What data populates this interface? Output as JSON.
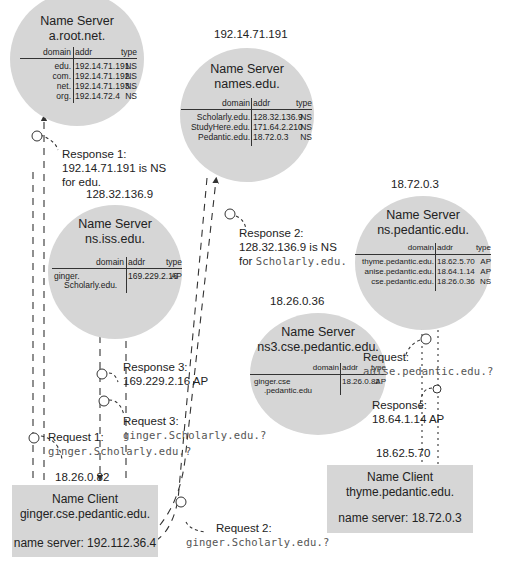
{
  "servers": [
    {
      "id": "root",
      "ip": "",
      "title": "Name Server",
      "hostname": "a.root.net.",
      "columns": [
        "domain",
        "addr",
        "type"
      ],
      "rows": [
        {
          "domain": "edu.",
          "addr": "192.14.71.191",
          "type": "NS"
        },
        {
          "domain": "com.",
          "addr": "192.14.71.192",
          "type": "NS"
        },
        {
          "domain": "net.",
          "addr": "192.14.71.193",
          "type": "NS"
        },
        {
          "domain": "org.",
          "addr": "192.14.72.4",
          "type": "NS"
        }
      ]
    },
    {
      "id": "edu",
      "ip": "192.14.71.191",
      "title": "Name Server",
      "hostname": "names.edu.",
      "columns": [
        "domain",
        "addr",
        "type"
      ],
      "rows": [
        {
          "domain": "Scholarly.edu.",
          "addr": "128.32.136.9",
          "type": "NS"
        },
        {
          "domain": "StudyHere.edu.",
          "addr": "171.64.2.210",
          "type": "NS"
        },
        {
          "domain": "Pedantic.edu.",
          "addr": "18.72.0.3",
          "type": "NS"
        }
      ]
    },
    {
      "id": "iss",
      "ip": "128.32.136.9",
      "title": "Name Server",
      "hostname": "ns.iss.edu.",
      "columns": [
        "domain",
        "addr",
        "type"
      ],
      "rows": [
        {
          "domain_line1": "ginger.",
          "domain_line2": "Scholarly.edu.",
          "addr": "169.229.2.16",
          "type": "AP"
        }
      ]
    },
    {
      "id": "pedantic",
      "ip": "18.72.0.3",
      "title": "Name Server",
      "hostname": "ns.pedantic.edu.",
      "columns": [
        "domain",
        "addr",
        "type"
      ],
      "rows": [
        {
          "domain": "thyme.pedantic.edu.",
          "addr": "18.62.5.70",
          "type": "AP"
        },
        {
          "domain": "anise.pedantic.edu.",
          "addr": "18.64.1.14",
          "type": "AP"
        },
        {
          "domain": "cse.pedantic.edu.",
          "addr": "18.26.0.36",
          "type": "NS"
        }
      ]
    },
    {
      "id": "cse",
      "ip": "18.26.0.36",
      "title": "Name Server",
      "hostname": "ns3.cse.pedantic.edu.",
      "columns": [
        "domain",
        "addr",
        "type"
      ],
      "rows": [
        {
          "domain_line1": "ginger.cse",
          "domain_line2": ".pedantic.edu",
          "addr": "18.26.0.82",
          "type": "AP"
        }
      ]
    }
  ],
  "clients": [
    {
      "id": "ginger",
      "ip": "18.26.0.82",
      "title": "Name Client",
      "hostname": "ginger.cse.pedantic.edu.",
      "name_server": "name server: 192.112.36.4"
    },
    {
      "id": "thyme",
      "ip": "18.62.5.70",
      "title": "Name Client",
      "hostname": "thyme.pedantic.edu.",
      "name_server": "name server: 18.72.0.3"
    }
  ],
  "messages": {
    "request1": {
      "label": "Request 1:",
      "query": "ginger.Scholarly.edu.?"
    },
    "response1": {
      "label": "Response 1:",
      "line2": "192.14.71.191 is NS",
      "line3": "for edu."
    },
    "request2": {
      "label": "Request 2:",
      "query": "ginger.Scholarly.edu.?"
    },
    "response2": {
      "label": "Response 2:",
      "line2": "128.32.136.9 is NS",
      "line3_prefix": "for ",
      "line3_mono": "Scholarly.edu."
    },
    "request3": {
      "label": "Request 3:",
      "query": "ginger.Scholarly.edu.?"
    },
    "response3": {
      "label": "Response 3:",
      "line2": "169.229.2.16 AP"
    },
    "request_anise": {
      "label": "Request:",
      "query": "anise.pedantic.edu.?"
    },
    "response_anise": {
      "label": "Response:",
      "line2": "18.64.1.14 AP"
    }
  },
  "colors": {
    "node_fill": "#d6d6d6",
    "line": "#333333",
    "text": "#222222",
    "mono_text": "#555555"
  }
}
